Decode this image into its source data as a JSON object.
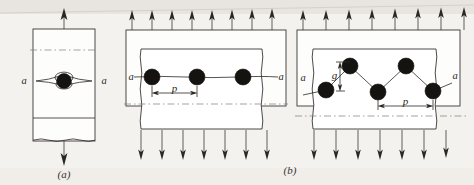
{
  "figure": {
    "background_color": "#f4f2ef",
    "ink_color": "#2b2824",
    "crack_fill_color": "#151310",
    "centerline_color": "#7f7c77"
  },
  "panels": [
    {
      "id": "a",
      "caption": "(a)",
      "description": "single central crack in a finite width plate under uniaxial tension",
      "crack_label_left": "a",
      "crack_label_right": "a",
      "load_arrows_top": 1,
      "load_arrows_bottom": 1,
      "crack_count": 1,
      "dimensions": []
    },
    {
      "id": "b-left",
      "caption": "(b)",
      "description": "row of collinear equally spaced cracks under uniaxial tension",
      "crack_label_left": "a",
      "crack_label_right": "a",
      "load_arrows_top": 8,
      "load_arrows_bottom": 7,
      "crack_count": 3,
      "dimensions": [
        {
          "symbol": "p",
          "meaning": "crack pitch (centre to centre spacing)",
          "orientation": "horizontal"
        }
      ]
    },
    {
      "id": "b-right",
      "caption": "(b)",
      "description": "staggered row of cracks under uniaxial tension",
      "crack_label_left": "a",
      "crack_label_right": "a",
      "load_arrows_top": 8,
      "load_arrows_bottom": 7,
      "crack_count": 5,
      "dimensions": [
        {
          "symbol": "g",
          "meaning": "stagger offset between crack rows",
          "orientation": "vertical"
        },
        {
          "symbol": "p",
          "meaning": "crack pitch (centre to centre spacing)",
          "orientation": "horizontal"
        }
      ]
    }
  ],
  "labels": {
    "caption_a": "(a)",
    "caption_b": "(b)",
    "a_left_1": "a",
    "a_right_1": "a",
    "a_left_2": "a",
    "a_right_2": "a",
    "a_left_3": "a",
    "a_right_3": "a",
    "p_mid": "p",
    "p_right": "p",
    "g_right": "g"
  }
}
